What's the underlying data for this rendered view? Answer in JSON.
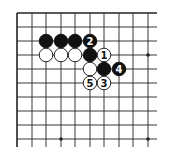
{
  "diagram": {
    "type": "go-board-fragment",
    "colors": {
      "background": "#ffffff",
      "line": "#222222",
      "black_stone": "#111111",
      "white_stone": "#ffffff",
      "stone_outline": "#111111"
    },
    "grid": {
      "columns_x": [
        17,
        32,
        46,
        61,
        75,
        90,
        104,
        119,
        133,
        148
      ],
      "rows_y": [
        13,
        27,
        41,
        55,
        69,
        83,
        97,
        111,
        125,
        139
      ],
      "right_extent": 157,
      "bottom_extent": 147,
      "top_edge": true,
      "left_edge": true
    },
    "star_points": [
      {
        "col": 9,
        "row": 3
      },
      {
        "col": 3,
        "row": 9
      },
      {
        "col": 9,
        "row": 9
      }
    ],
    "stones": [
      {
        "color": "black",
        "col": 2,
        "row": 2,
        "label": ""
      },
      {
        "color": "black",
        "col": 3,
        "row": 2,
        "label": ""
      },
      {
        "color": "black",
        "col": 4,
        "row": 2,
        "label": ""
      },
      {
        "color": "black",
        "col": 5,
        "row": 2,
        "label": "2"
      },
      {
        "color": "white",
        "col": 2,
        "row": 3,
        "label": ""
      },
      {
        "color": "white",
        "col": 3,
        "row": 3,
        "label": ""
      },
      {
        "color": "white",
        "col": 4,
        "row": 3,
        "label": ""
      },
      {
        "color": "black",
        "col": 5,
        "row": 3,
        "label": ""
      },
      {
        "color": "white",
        "col": 6,
        "row": 3,
        "label": "1"
      },
      {
        "color": "white",
        "col": 5,
        "row": 4,
        "label": ""
      },
      {
        "color": "black",
        "col": 6,
        "row": 4,
        "label": ""
      },
      {
        "color": "black",
        "col": 7,
        "row": 4,
        "label": "4"
      },
      {
        "color": "white",
        "col": 5,
        "row": 5,
        "label": "5"
      },
      {
        "color": "white",
        "col": 6,
        "row": 5,
        "label": "3"
      }
    ]
  }
}
